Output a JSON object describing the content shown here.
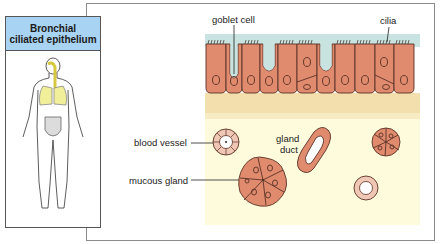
{
  "side_panel": {
    "title_line1": "Bronchial",
    "title_line2": "ciliated epithelium",
    "figure": "human-body-respiratory-highlight-icon",
    "header_color": "#a9d3f2",
    "lung_color": "#f2ef9a"
  },
  "diagram": {
    "labels": {
      "goblet_cell": "goblet cell",
      "cilia": "cilia",
      "blood_vessel": "blood vessel",
      "gland_duct_line1": "gland",
      "gland_duct_line2": "duct",
      "mucous_gland": "mucous gland"
    },
    "colors": {
      "lumen": "#c9e3e0",
      "cell": "#e08a6e",
      "basement": "#f3dfae",
      "connective": "#fdfbdc",
      "outline": "#3a2a22"
    }
  }
}
